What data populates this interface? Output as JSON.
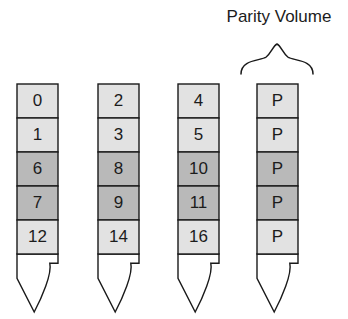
{
  "diagram": {
    "title": "Parity Volume",
    "colors": {
      "light_cell": "#e2e2e2",
      "dark_cell": "#b9b9b9",
      "stroke": "#1a1a1a",
      "background": "#ffffff",
      "text": "#1c1c1c"
    },
    "row_shading": [
      "light",
      "light",
      "dark",
      "dark",
      "light"
    ],
    "columns": [
      {
        "name": "volume-1",
        "cells": [
          {
            "label": "0",
            "shade": "light"
          },
          {
            "label": "1",
            "shade": "light"
          },
          {
            "label": "6",
            "shade": "dark"
          },
          {
            "label": "7",
            "shade": "dark"
          },
          {
            "label": "12",
            "shade": "light"
          }
        ]
      },
      {
        "name": "volume-2",
        "cells": [
          {
            "label": "2",
            "shade": "light"
          },
          {
            "label": "3",
            "shade": "light"
          },
          {
            "label": "8",
            "shade": "dark"
          },
          {
            "label": "9",
            "shade": "dark"
          },
          {
            "label": "14",
            "shade": "light"
          }
        ]
      },
      {
        "name": "volume-3",
        "cells": [
          {
            "label": "4",
            "shade": "light"
          },
          {
            "label": "5",
            "shade": "light"
          },
          {
            "label": "10",
            "shade": "dark"
          },
          {
            "label": "11",
            "shade": "dark"
          },
          {
            "label": "16",
            "shade": "light"
          }
        ]
      },
      {
        "name": "parity-volume",
        "cells": [
          {
            "label": "P",
            "shade": "light"
          },
          {
            "label": "P",
            "shade": "light"
          },
          {
            "label": "P",
            "shade": "dark"
          },
          {
            "label": "P",
            "shade": "dark"
          },
          {
            "label": "P",
            "shade": "light"
          }
        ]
      }
    ],
    "layout": {
      "column_x": [
        17,
        98,
        178,
        257
      ],
      "column_width": 41,
      "cell_top": 84,
      "cell_height": 34,
      "cell_count": 5,
      "nib_height": 58,
      "title_x": 279,
      "title_y": 22,
      "brace_center_x": 277,
      "brace_top_y": 44,
      "brace_bottom_y": 74,
      "brace_half_width": 36
    }
  }
}
